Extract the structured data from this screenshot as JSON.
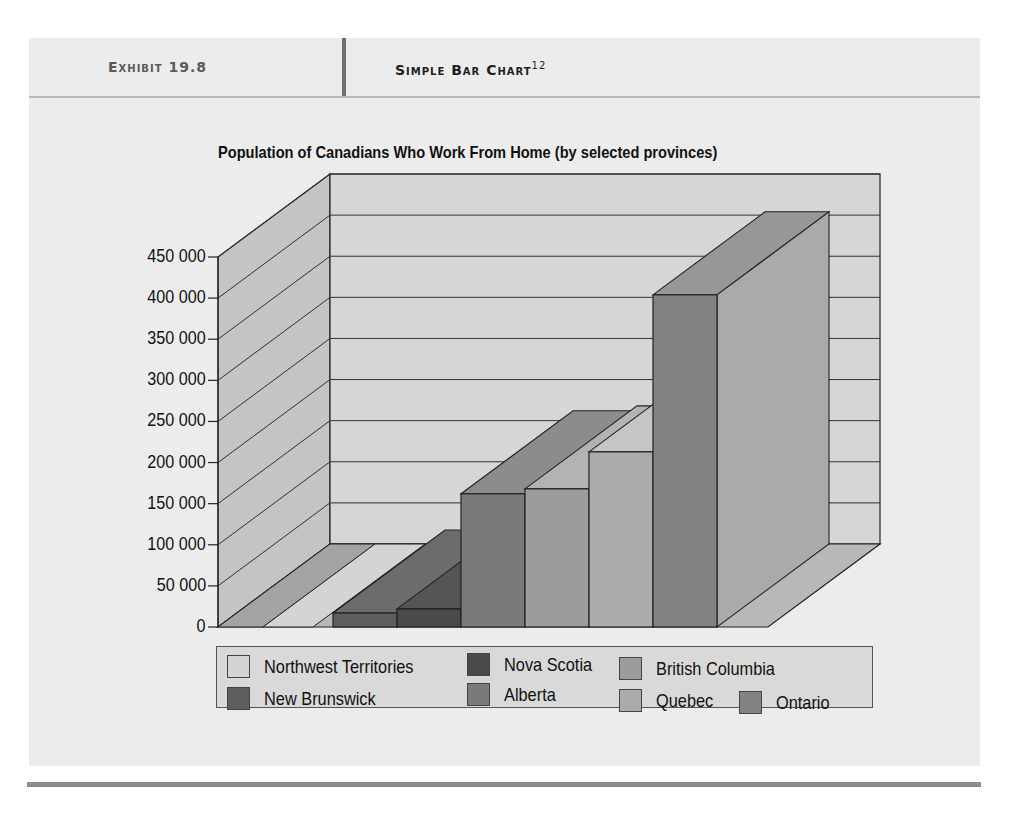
{
  "header": {
    "exhibit_label": "Exhibit 19.8",
    "exhibit_title": "Simple Bar Chart",
    "footnote": "12"
  },
  "colors": {
    "panel_bg": "#ececec",
    "back_wall": "#d6d6d6",
    "side_wall": "#c4c4c4",
    "floor": "#b8b8b8",
    "grid_line": "#333333"
  },
  "chart_data": {
    "type": "bar",
    "title": "Population of Canadians Who Work From Home (by selected provinces)",
    "xlabel": "",
    "ylabel": "",
    "ylim": [
      0,
      450000
    ],
    "yticks": [
      "0",
      "50 000",
      "100 000",
      "150 000",
      "200 000",
      "250 000",
      "300 000",
      "350 000",
      "400 000",
      "450 000"
    ],
    "grid": true,
    "three_d": true,
    "legend_position": "bottom",
    "categories": [
      "Northwest Territories",
      "New Brunswick",
      "Nova Scotia",
      "Alberta",
      "British Columbia",
      "Quebec",
      "Ontario"
    ],
    "series": [
      {
        "name": "Northwest Territories",
        "value": 1000,
        "color": "#d4d4d4"
      },
      {
        "name": "New Brunswick",
        "value": 17000,
        "color": "#5e5e5e"
      },
      {
        "name": "Nova Scotia",
        "value": 22000,
        "color": "#4a4a4a"
      },
      {
        "name": "Alberta",
        "value": 162000,
        "color": "#7a7a7a"
      },
      {
        "name": "British Columbia",
        "value": 168000,
        "color": "#9c9c9c"
      },
      {
        "name": "Quebec",
        "value": 213000,
        "color": "#ababab"
      },
      {
        "name": "Ontario",
        "value": 404000,
        "color": "#838383"
      }
    ]
  },
  "legend": {
    "items": [
      {
        "label": "Northwest Territories",
        "color": "#d4d4d4"
      },
      {
        "label": "Nova Scotia",
        "color": "#4a4a4a"
      },
      {
        "label": "British Columbia",
        "color": "#9c9c9c"
      },
      {
        "label": "New Brunswick",
        "color": "#5e5e5e"
      },
      {
        "label": "Alberta",
        "color": "#7a7a7a"
      },
      {
        "label": "Quebec",
        "color": "#ababab"
      },
      {
        "label": "Ontario",
        "color": "#838383"
      }
    ]
  }
}
